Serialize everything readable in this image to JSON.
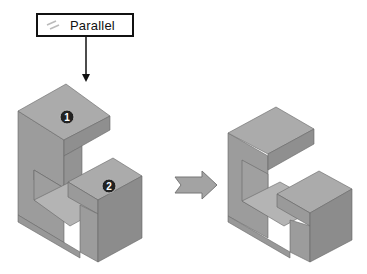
{
  "callout": {
    "label": "Parallel",
    "icon": "parallel-constraint-icon"
  },
  "markers": [
    {
      "label": "1"
    },
    {
      "label": "2"
    }
  ],
  "colors": {
    "face_top": "#a9a9a9",
    "face_left": "#9a9a9a",
    "face_right": "#8a8a8a",
    "marker": "#222222",
    "arrow": "#9c9c9c"
  }
}
